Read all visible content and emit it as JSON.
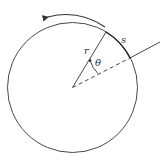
{
  "diagram": {
    "title": "",
    "labels": {
      "radius": "r",
      "angle": "θ",
      "arc_length": "s"
    },
    "colors": {
      "stroke": "#333333",
      "background": "#ffffff"
    },
    "elements": [
      {
        "type": "circle",
        "description": "circle of radius r"
      },
      {
        "type": "radius-line",
        "description": "solid radius from center to circle"
      },
      {
        "type": "reference-line",
        "description": "dashed line from center extending beyond circle as solid"
      },
      {
        "type": "angle-arc",
        "description": "small arc with arrow marking angle θ between lines"
      },
      {
        "type": "rotation-arrow",
        "description": "curved arrow above circle indicating counterclockwise rotation"
      }
    ]
  }
}
